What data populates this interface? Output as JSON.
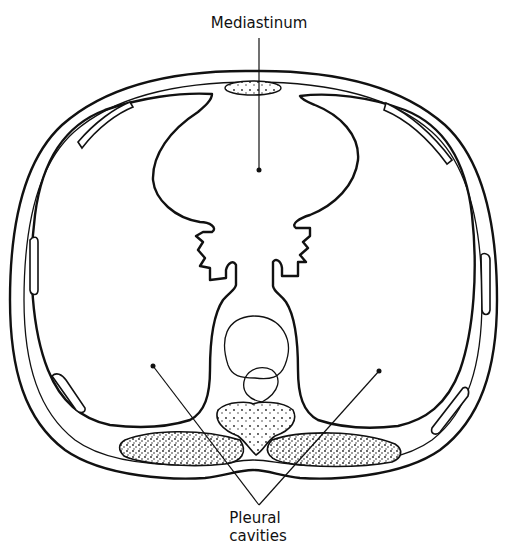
{
  "figure": {
    "type": "anatomical cross-section of thorax",
    "labels": {
      "mediastinum": "Mediastinum",
      "pleural_line1": "Pleural",
      "pleural_line2": "cavities"
    },
    "colors": {
      "ink": "#111111",
      "background": "#ffffff"
    }
  }
}
